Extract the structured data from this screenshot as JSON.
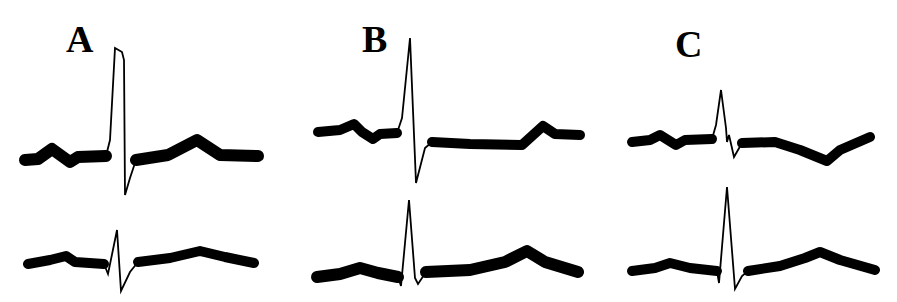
{
  "figure": {
    "panels": [
      {
        "label": "A",
        "label_pos": {
          "x": 66,
          "y": 22
        },
        "traces": [
          {
            "name": "upper-trace",
            "baseline_y": 156,
            "width": 12,
            "pre": "M25,160 L38,159 L52,149 L70,162 L78,157 L106,156",
            "qrs": "M106,156 L110,140 L115,48 L122,52 L124,60 L125,195 L130,178 L136,160",
            "post": "M136,160 L168,155 L197,140 L220,155 L258,156"
          },
          {
            "name": "lower-trace",
            "baseline_y": 263,
            "width": 10,
            "pre": "M28,264 L50,260 L66,256 L75,262 L104,264",
            "qrs": "M104,264 L108,274 L117,230 L121,291 L130,272 L138,262",
            "post": "M138,262 L170,258 L200,251 L225,257 L254,263"
          }
        ]
      },
      {
        "label": "B",
        "label_pos": {
          "x": 362,
          "y": 22
        },
        "traces": [
          {
            "name": "upper-trace",
            "baseline_y": 133,
            "width": 10,
            "pre": "M318,132 L340,130 L354,124 L362,132 L373,139 L380,134 L397,133",
            "qrs": "M397,133 L402,118 L410,38 L416,183 L425,148 L432,142",
            "post": "M432,142 L470,144 L522,145 L543,126 L555,134 L580,135"
          },
          {
            "name": "lower-trace",
            "baseline_y": 275,
            "width": 12,
            "pre": "M317,277 L340,274 L360,268 L378,273 L398,277",
            "qrs": "M398,277 L401,286 L409,200 L415,278 L418,284 L426,272",
            "post": "M426,272 L470,270 L505,262 L527,251 L545,262 L578,272"
          }
        ]
      },
      {
        "label": "C",
        "label_pos": {
          "x": 675,
          "y": 27
        },
        "traces": [
          {
            "name": "upper-trace",
            "baseline_y": 140,
            "width": 10,
            "pre": "M632,142 L650,140 L660,135 L668,140 L676,145 L685,140 L712,139",
            "qrs": "M712,139 L716,125 L721,90 L726,128 L727,142 L729,135 L734,157 L742,143",
            "post": "M742,143 L775,142 L800,150 L827,161 L840,150 L870,137"
          },
          {
            "name": "lower-trace",
            "baseline_y": 272,
            "width": 10,
            "pre": "M632,271 L655,268 L670,263 L690,268 L717,271",
            "qrs": "M717,271 L719,283 L727,187 L735,289 L742,276 L748,271",
            "post": "M748,271 L780,266 L805,258 L820,252 L840,260 L875,270"
          }
        ]
      }
    ]
  }
}
